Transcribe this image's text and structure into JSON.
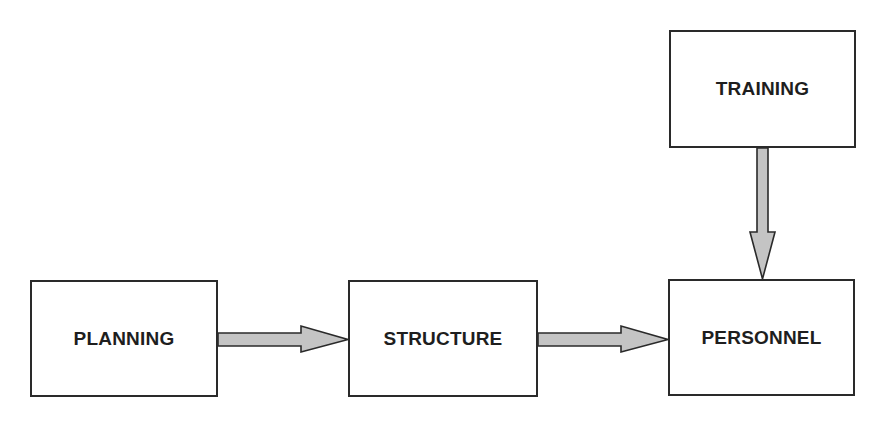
{
  "diagram": {
    "type": "flowchart",
    "nodes": [
      {
        "id": "planning",
        "label": "PLANNING"
      },
      {
        "id": "structure",
        "label": "STRUCTURE"
      },
      {
        "id": "personnel",
        "label": "PERSONNEL"
      },
      {
        "id": "training",
        "label": "TRAINING"
      }
    ],
    "edges": [
      {
        "from": "planning",
        "to": "structure",
        "direction": "right"
      },
      {
        "from": "structure",
        "to": "personnel",
        "direction": "right"
      },
      {
        "from": "training",
        "to": "personnel",
        "direction": "down"
      }
    ],
    "colors": {
      "box_border": "#2a2a2a",
      "box_fill": "#ffffff",
      "arrow_fill": "#c4c4c4",
      "arrow_stroke": "#2a2a2a",
      "text": "#1e1e1e",
      "background": "#ffffff"
    }
  }
}
